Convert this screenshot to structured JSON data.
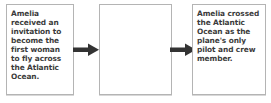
{
  "diagram": {
    "type": "horizontal-flow-chart",
    "background_color": "#ffffff",
    "box_border_color": "#b4b4b4",
    "text_color": "#3b3b3b",
    "arrow_color": "#333333",
    "steps": [
      {
        "id": "step-1",
        "order": 1,
        "text": "Amelia received an invitation to become the first woman to fly across the Atlantic Ocean.",
        "empty": false
      },
      {
        "id": "step-2",
        "order": 2,
        "text": "",
        "empty": true
      },
      {
        "id": "step-3",
        "order": 3,
        "text": "Amelia crossed the Atlantic Ocean as the plane's only pilot and crew member.",
        "empty": false
      }
    ],
    "connectors": [
      {
        "id": "arrow-1",
        "from": "step-1",
        "to": "step-2",
        "icon": "arrow-right-icon"
      },
      {
        "id": "arrow-2",
        "from": "step-2",
        "to": "step-3",
        "icon": "arrow-right-icon"
      }
    ]
  }
}
